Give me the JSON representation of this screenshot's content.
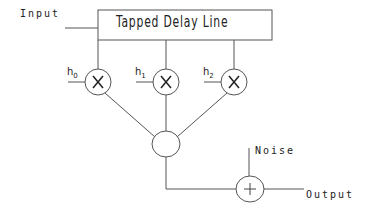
{
  "diagram": {
    "title_box": "Tapped Delay Line",
    "input_label": "Input",
    "output_label": "Output",
    "noise_label": "Noise",
    "coefficients": [
      {
        "base": "h",
        "sub": "0"
      },
      {
        "base": "h",
        "sub": "1"
      },
      {
        "base": "h",
        "sub": "2"
      }
    ],
    "multiplier_symbol": "×",
    "adder_symbol": "+",
    "line_color": "#555555",
    "text_color": "#222222"
  }
}
